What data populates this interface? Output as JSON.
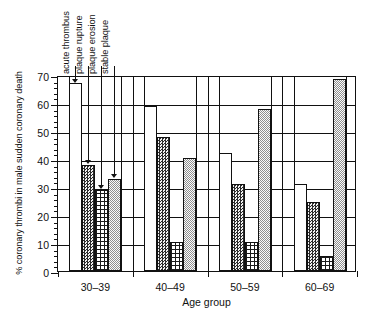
{
  "chart_data": {
    "type": "bar",
    "title": "",
    "xlabel": "Age group",
    "ylabel": "% coronary thrombi in male sudden coronary death",
    "categories": [
      "30–39",
      "40–49",
      "50–59",
      "60–69"
    ],
    "ylim": [
      0,
      70
    ],
    "ytick_labels": [
      "0",
      "10",
      "20",
      "30",
      "40",
      "50",
      "60",
      "70"
    ],
    "ytick_values": [
      0,
      10,
      20,
      30,
      40,
      50,
      60,
      70
    ],
    "ytick_minor_step": 2,
    "grid": "horizontal-and-vertical",
    "legend_position": "annotated-arrows-top",
    "series": [
      {
        "name": "acute thrombus",
        "pattern": "white",
        "values": [
          67.0,
          59.0,
          42.0,
          31.0
        ]
      },
      {
        "name": "plaque rupture",
        "pattern": "dark-dotted",
        "values": [
          38.0,
          48.0,
          31.0,
          24.5
        ]
      },
      {
        "name": "plaque erosion",
        "pattern": "cross-hatch",
        "values": [
          29.0,
          10.5,
          10.5,
          5.5
        ]
      },
      {
        "name": "stable plaque",
        "pattern": "light-dotted",
        "values": [
          33.0,
          40.5,
          58.0,
          68.5
        ]
      }
    ],
    "annotations": [
      {
        "label": "acute thrombus",
        "target_series": 0,
        "target_category": 0
      },
      {
        "label": "plaque rupture",
        "target_series": 1,
        "target_category": 0
      },
      {
        "label": "plaque erosion",
        "target_series": 2,
        "target_category": 0
      },
      {
        "label": "stable plaque",
        "target_series": 3,
        "target_category": 0
      }
    ]
  }
}
